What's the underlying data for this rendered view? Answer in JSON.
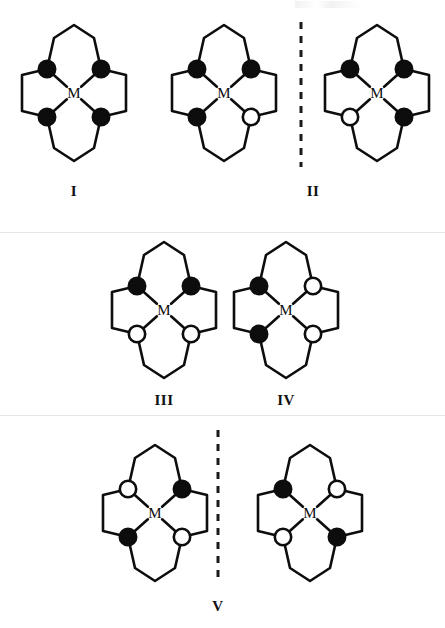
{
  "figure": {
    "width": 445,
    "height": 628,
    "background": "#ffffff",
    "metal_label": "M",
    "colors": {
      "bond": "#0d0d0d",
      "donor_filled": "#0d0d0d",
      "donor_open_fill": "#ffffff",
      "donor_open_stroke": "#0d0d0d",
      "label": "#111111",
      "divider": "#1a1a1a"
    },
    "geometry": {
      "ring_scale": 1.0,
      "donor_radius": 8.2,
      "bond_width": 2.6,
      "donor_stroke_width": 2.6,
      "metal_font_size": 15
    },
    "legend_semantics": {
      "filled_circle": "donor atom, filled",
      "open_circle": "donor atom, open"
    }
  },
  "structures": [
    {
      "id": "I",
      "name": "structure-I",
      "center": {
        "x": 74,
        "y": 93
      },
      "donors": {
        "top_left": "filled",
        "top_right": "filled",
        "bottom_left": "filled",
        "bottom_right": "filled"
      }
    },
    {
      "id": "II-left",
      "name": "structure-II-left",
      "center": {
        "x": 224,
        "y": 93
      },
      "donors": {
        "top_left": "filled",
        "top_right": "filled",
        "bottom_left": "filled",
        "bottom_right": "open"
      }
    },
    {
      "id": "II-right",
      "name": "structure-II-right",
      "center": {
        "x": 377,
        "y": 93
      },
      "donors": {
        "top_left": "filled",
        "top_right": "filled",
        "bottom_left": "open",
        "bottom_right": "filled"
      }
    },
    {
      "id": "III",
      "name": "structure-III",
      "center": {
        "x": 164,
        "y": 310
      },
      "donors": {
        "top_left": "filled",
        "top_right": "filled",
        "bottom_left": "open",
        "bottom_right": "open"
      }
    },
    {
      "id": "IV",
      "name": "structure-IV",
      "center": {
        "x": 286,
        "y": 310
      },
      "donors": {
        "top_left": "filled",
        "top_right": "open",
        "bottom_left": "filled",
        "bottom_right": "open"
      }
    },
    {
      "id": "V-left",
      "name": "structure-V-left",
      "center": {
        "x": 155,
        "y": 513
      },
      "donors": {
        "top_left": "open",
        "top_right": "filled",
        "bottom_left": "filled",
        "bottom_right": "open"
      }
    },
    {
      "id": "V-right",
      "name": "structure-V-right",
      "center": {
        "x": 310,
        "y": 513
      },
      "donors": {
        "top_left": "filled",
        "top_right": "open",
        "bottom_left": "open",
        "bottom_right": "filled"
      }
    }
  ],
  "dividers": [
    {
      "name": "divider-row1",
      "x": 301,
      "y1": 22,
      "y2": 167
    },
    {
      "name": "divider-row3",
      "x": 218,
      "y1": 430,
      "y2": 578
    }
  ],
  "labels": [
    {
      "id": "label-I",
      "text": "I",
      "x": 74,
      "y": 183
    },
    {
      "id": "label-II",
      "text": "II",
      "x": 313,
      "y": 183
    },
    {
      "id": "label-III",
      "text": "III",
      "x": 164,
      "y": 392
    },
    {
      "id": "label-IV",
      "text": "IV",
      "x": 286,
      "y": 392
    },
    {
      "id": "label-V",
      "text": "V",
      "x": 218,
      "y": 598
    }
  ]
}
